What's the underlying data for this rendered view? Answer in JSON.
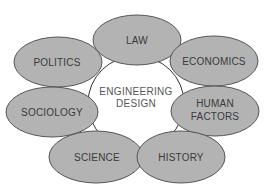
{
  "diagram": {
    "type": "hub-and-spoke ellipse cluster",
    "colors": {
      "background": "#ffffff",
      "node_fill": "#b3b3b3",
      "node_stroke": "#555555",
      "center_fill": "#ffffff",
      "center_stroke": "#333333",
      "text": "#3a3a3a"
    },
    "center": {
      "line1": "ENGINEERING",
      "line2": "DESIGN"
    },
    "nodes": [
      {
        "id": "law",
        "line1": "LAW",
        "line2": ""
      },
      {
        "id": "politics",
        "line1": "POLITICS",
        "line2": ""
      },
      {
        "id": "economics",
        "line1": "ECONOMICS",
        "line2": ""
      },
      {
        "id": "sociology",
        "line1": "SOCIOLOGY",
        "line2": ""
      },
      {
        "id": "human-factors",
        "line1": "HUMAN",
        "line2": "FACTORS"
      },
      {
        "id": "science",
        "line1": "SCIENCE",
        "line2": ""
      },
      {
        "id": "history",
        "line1": "HISTORY",
        "line2": ""
      }
    ]
  }
}
